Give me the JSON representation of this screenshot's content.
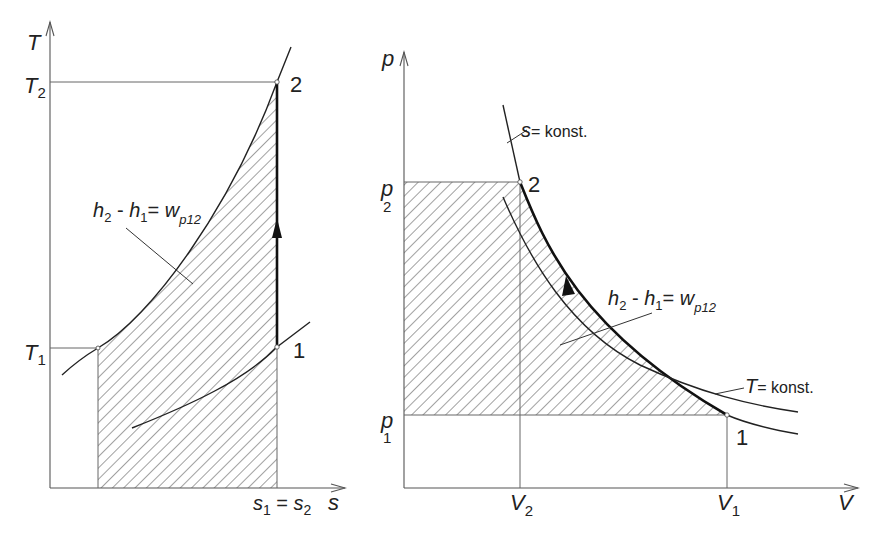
{
  "figure": {
    "ts_diagram": {
      "y_axis_label": "T",
      "x_axis_label": "s",
      "tick_T2_main": "T",
      "tick_T2_sub": "2",
      "tick_T1_main": "T",
      "tick_T1_sub": "1",
      "tick_s_label_a": "s",
      "tick_s_sub_a": "1",
      "tick_s_eq": " = ",
      "tick_s_label_b": "s",
      "tick_s_sub_b": "2",
      "point_1": "1",
      "point_2": "2",
      "area_label": {
        "h2": "h",
        "h2_sub": "2",
        "minus": " - ",
        "h1": "h",
        "h1_sub": "1",
        "eq": "= ",
        "w": "w",
        "w_sub": "p12"
      }
    },
    "pv_diagram": {
      "y_axis_label": "p",
      "x_axis_label": "V",
      "tick_p2_main": "p",
      "tick_p2_sub": "2",
      "tick_p1_main": "p",
      "tick_p1_sub": "1",
      "tick_V2_main": "V",
      "tick_V2_sub": "2",
      "tick_V1_main": "V",
      "tick_V1_sub": "1",
      "point_1": "1",
      "point_2": "2",
      "isentrope_label_var": "s",
      "isentrope_label_rest": "= konst.",
      "isotherm_label_var": "T",
      "isotherm_label_rest": "= konst.",
      "area_label": {
        "h2": "h",
        "h2_sub": "2",
        "minus": " - ",
        "h1": "h",
        "h1_sub": "1",
        "eq": "= ",
        "w": "w",
        "w_sub": "p12"
      }
    }
  }
}
